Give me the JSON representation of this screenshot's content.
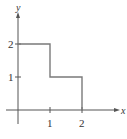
{
  "chart_data": {
    "type": "line",
    "subtype": "step",
    "title": "",
    "xlabel": "x",
    "ylabel": "y",
    "x_ticks": [
      "1",
      "2"
    ],
    "y_ticks": [
      "1",
      "2"
    ],
    "xlim": [
      0,
      3
    ],
    "ylim": [
      0,
      3
    ],
    "grid": false,
    "series": [
      {
        "name": "step function",
        "points": [
          [
            0,
            2
          ],
          [
            1,
            2
          ],
          [
            1,
            1
          ],
          [
            2,
            1
          ],
          [
            2,
            0
          ]
        ]
      }
    ],
    "colors": {
      "line": "#7a7a7a",
      "axis": "#555555"
    }
  }
}
